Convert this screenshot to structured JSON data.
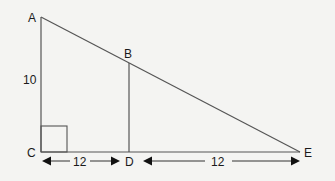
{
  "diagram": {
    "type": "right-triangle-similar-triangles",
    "points": {
      "A": {
        "label": "A"
      },
      "B": {
        "label": "B"
      },
      "C": {
        "label": "C"
      },
      "D": {
        "label": "D"
      },
      "E": {
        "label": "E"
      }
    },
    "measurements": {
      "AC": "10",
      "CD": "12",
      "DE": "12"
    },
    "right_angle_at": "C",
    "segments": [
      "AC",
      "CE",
      "AE",
      "BD"
    ],
    "colors": {
      "line": "#555555",
      "text": "#1a1a1a",
      "background": "#f4f4f2"
    }
  }
}
